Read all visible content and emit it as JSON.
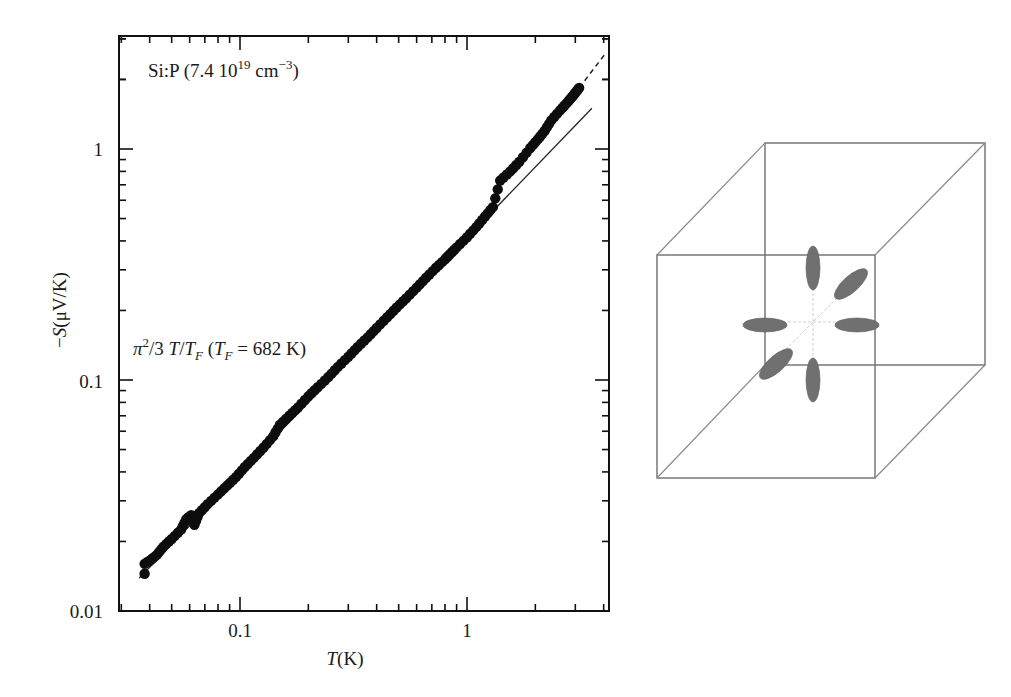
{
  "chart_data": [
    {
      "type": "scatter",
      "title": "",
      "annotation_sample": "Si:P (7.4 10^19 cm^-3)",
      "annotation_fit": "π²/3 T/T_F (T_F = 682 K)",
      "xlabel": "T(K)",
      "ylabel": "−S(μV/K)",
      "xscale": "log",
      "yscale": "log",
      "xlim": [
        0.03,
        4.27
      ],
      "ylim": [
        0.01,
        3.09
      ],
      "xticks": [
        0.1,
        1
      ],
      "xtick_labels": [
        "0.1",
        "1"
      ],
      "yticks": [
        0.01,
        0.1,
        1
      ],
      "ytick_labels": [
        "0.01",
        "0.1",
        "1"
      ],
      "grid": false,
      "legend": "none",
      "series": [
        {
          "name": "Si:P data",
          "style": "filled-circles",
          "x": [
            0.038,
            0.038,
            0.04,
            0.043,
            0.046,
            0.05,
            0.055,
            0.058,
            0.061,
            0.063,
            0.066,
            0.072,
            0.08,
            0.088,
            0.096,
            0.105,
            0.115,
            0.127,
            0.14,
            0.15,
            0.165,
            0.18,
            0.2,
            0.22,
            0.245,
            0.27,
            0.3,
            0.33,
            0.365,
            0.4,
            0.445,
            0.49,
            0.54,
            0.6,
            0.66,
            0.73,
            0.8,
            0.84,
            0.9,
            1.0,
            1.1,
            1.2,
            1.3,
            1.4,
            1.55,
            1.7,
            1.9,
            2.05,
            2.2,
            2.35,
            2.57,
            2.75,
            2.9,
            3.0,
            3.12
          ],
          "y": [
            0.0145,
            0.016,
            0.0165,
            0.0175,
            0.019,
            0.0205,
            0.0225,
            0.025,
            0.026,
            0.0236,
            0.0265,
            0.029,
            0.032,
            0.035,
            0.038,
            0.042,
            0.046,
            0.051,
            0.057,
            0.064,
            0.07,
            0.076,
            0.085,
            0.093,
            0.103,
            0.114,
            0.126,
            0.139,
            0.153,
            0.168,
            0.187,
            0.206,
            0.226,
            0.251,
            0.277,
            0.306,
            0.333,
            0.35,
            0.375,
            0.415,
            0.46,
            0.51,
            0.56,
            0.73,
            0.8,
            0.88,
            1.01,
            1.1,
            1.2,
            1.33,
            1.47,
            1.58,
            1.68,
            1.75,
            1.84
          ]
        },
        {
          "name": "π²/3 T/T_F fit",
          "style": "solid-line",
          "x": [
            0.036,
            3.55
          ],
          "y": [
            0.0139,
            1.5
          ]
        },
        {
          "name": "extrapolation",
          "style": "dashed-line",
          "x": [
            3.12,
            4.05
          ],
          "y": [
            1.84,
            2.57
          ]
        }
      ]
    },
    {
      "type": "diagram",
      "title": "",
      "description": "Wireframe cube with six ellipsoidal constant-energy surfaces along ±x, ±y, ±z axes"
    }
  ],
  "plot": {
    "sample_label": "Si:P (7.4 10",
    "sample_exp": "19",
    "sample_unit": " cm",
    "sample_unit_exp": "−3",
    "sample_close": ")",
    "fit_pi": "π",
    "fit_sq": "2",
    "fit_text1": "/3 ",
    "fit_T": "T",
    "fit_slash": "/",
    "fit_TF": "T",
    "fit_F": "F",
    "fit_paren": " (",
    "fit_TF2": "T",
    "fit_F2": "F",
    "fit_eq": " = 682 K)",
    "ylabel_minus": "−",
    "ylabel_S": "S",
    "ylabel_rest": "(μV/K)",
    "xlabel_T": "T",
    "xlabel_rest": "(K)",
    "ytick_1": "1",
    "ytick_01": "0.1",
    "ytick_001": "0.01",
    "xtick_01": "0.1",
    "xtick_1": "1"
  },
  "colors": {
    "axis": "#111111",
    "data": "#0d0d0d",
    "cube_edge": "#6e6e6e",
    "ellipsoid": "#707070",
    "axis_lines": "#c8c8c8"
  }
}
